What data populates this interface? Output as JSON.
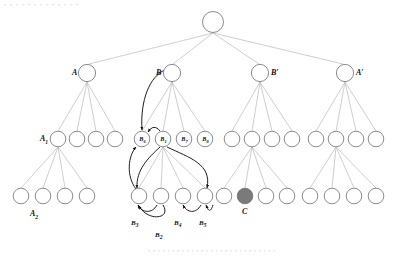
{
  "figure": {
    "type": "tree-diagram",
    "background_color": "#ffffff",
    "edge_color": "#b9b9bd",
    "node_stroke_color": "#6f6f76",
    "node_fill_color": "#ffffff",
    "arrow_color": "#111111",
    "highlight_fill_color": "#7a7a7a",
    "top_faint_text": "• • • • •      • • • • • • • •",
    "bottom_faint_text": "• • • • • • • • • • • • • • • • • • • • • • • • • • •"
  },
  "levels": {
    "root_y": 22,
    "level1_y": 73,
    "level2_y": 139,
    "level3_y": 196
  },
  "nodes": {
    "root": {
      "id": "root",
      "cx": 213,
      "cy": 22,
      "r": 11,
      "label": "",
      "fill": "#ffffff"
    },
    "level1": [
      {
        "id": "A",
        "cx": 87,
        "cy": 73,
        "r": 9,
        "label": "A",
        "label_pos": "left"
      },
      {
        "id": "B",
        "cx": 172,
        "cy": 73,
        "r": 9,
        "label": "B",
        "label_pos": "left"
      },
      {
        "id": "Bp",
        "cx": 260,
        "cy": 73,
        "r": 9,
        "label": "B′",
        "label_pos": "right"
      },
      {
        "id": "Ap",
        "cx": 345,
        "cy": 73,
        "r": 9,
        "label": "A′",
        "label_pos": "right"
      }
    ],
    "level2": [
      {
        "id": "A1",
        "cx": 58,
        "cy": 139,
        "r": 8,
        "label": "A",
        "sub": "1",
        "label_pos": "left",
        "inner": ""
      },
      {
        "id": "a2",
        "cx": 77,
        "cy": 139,
        "r": 8,
        "inner": ""
      },
      {
        "id": "a3",
        "cx": 96,
        "cy": 139,
        "r": 8,
        "inner": ""
      },
      {
        "id": "a4",
        "cx": 115,
        "cy": 139,
        "r": 8,
        "inner": ""
      },
      {
        "id": "B6",
        "cx": 142,
        "cy": 139,
        "r": 8,
        "inner": "B",
        "inner_sub": "6"
      },
      {
        "id": "B1",
        "cx": 163,
        "cy": 139,
        "r": 8,
        "inner": "B",
        "inner_sub": "1"
      },
      {
        "id": "B7",
        "cx": 184,
        "cy": 139,
        "r": 8,
        "inner": "B",
        "inner_sub": "7"
      },
      {
        "id": "B8",
        "cx": 205,
        "cy": 139,
        "r": 8,
        "inner": "B",
        "inner_sub": "8"
      },
      {
        "id": "c1",
        "cx": 232,
        "cy": 139,
        "r": 8,
        "inner": ""
      },
      {
        "id": "c2",
        "cx": 252,
        "cy": 139,
        "r": 8,
        "inner": ""
      },
      {
        "id": "c3",
        "cx": 272,
        "cy": 139,
        "r": 8,
        "inner": ""
      },
      {
        "id": "c4",
        "cx": 292,
        "cy": 139,
        "r": 8,
        "inner": ""
      },
      {
        "id": "d1",
        "cx": 316,
        "cy": 139,
        "r": 8,
        "inner": ""
      },
      {
        "id": "d2",
        "cx": 336,
        "cy": 139,
        "r": 8,
        "inner": ""
      },
      {
        "id": "d3",
        "cx": 356,
        "cy": 139,
        "r": 8,
        "inner": ""
      },
      {
        "id": "d4",
        "cx": 376,
        "cy": 139,
        "r": 8,
        "inner": ""
      }
    ],
    "level3": [
      {
        "id": "A2",
        "cx": 21,
        "cy": 196,
        "r": 8,
        "label": "A",
        "sub": "2",
        "label_pos": "below"
      },
      {
        "id": "e2",
        "cx": 43,
        "cy": 196,
        "r": 8
      },
      {
        "id": "e3",
        "cx": 65,
        "cy": 196,
        "r": 8
      },
      {
        "id": "e4",
        "cx": 87,
        "cy": 196,
        "r": 8
      },
      {
        "id": "f1",
        "cx": 139,
        "cy": 196,
        "r": 8,
        "arrow_label": "B",
        "arrow_sub": "3"
      },
      {
        "id": "f2",
        "cx": 161,
        "cy": 196,
        "r": 8
      },
      {
        "id": "f3",
        "cx": 183,
        "cy": 196,
        "r": 8,
        "arrow_label": "B",
        "arrow_sub": "4"
      },
      {
        "id": "f4",
        "cx": 205,
        "cy": 196,
        "r": 8,
        "arrow_label": "B",
        "arrow_sub": "5"
      },
      {
        "id": "g1",
        "cx": 224,
        "cy": 196,
        "r": 8
      },
      {
        "id": "C",
        "cx": 245,
        "cy": 196,
        "r": 8,
        "label": "C",
        "label_pos": "below",
        "fill": "#7a7a7a"
      },
      {
        "id": "g3",
        "cx": 266,
        "cy": 196,
        "r": 8
      },
      {
        "id": "g4",
        "cx": 287,
        "cy": 196,
        "r": 8
      },
      {
        "id": "h1",
        "cx": 310,
        "cy": 196,
        "r": 8
      },
      {
        "id": "h2",
        "cx": 332,
        "cy": 196,
        "r": 8
      },
      {
        "id": "h3",
        "cx": 354,
        "cy": 196,
        "r": 8
      },
      {
        "id": "h4",
        "cx": 376,
        "cy": 196,
        "r": 8
      }
    ]
  },
  "labels": {
    "A": "A",
    "B": "B",
    "Bp": "B′",
    "Ap": "A′",
    "A1": "A",
    "A1_sub": "1",
    "A2": "A",
    "A2_sub": "2",
    "C": "C",
    "B1": "B",
    "B1_sub": "1",
    "B2": "B",
    "B2_sub": "2",
    "B3": "B",
    "B3_sub": "3",
    "B4": "B",
    "B4_sub": "4",
    "B5": "B",
    "B5_sub": "5",
    "B6": "B",
    "B6_sub": "6",
    "B7": "B",
    "B7_sub": "7",
    "B8": "B",
    "B8_sub": "8"
  },
  "arrows": [
    {
      "name": "B-to-B6",
      "from": "B",
      "to": "B6",
      "label": ""
    },
    {
      "name": "B1-to-B6",
      "from": "B1",
      "to": "B6",
      "label": "B1"
    },
    {
      "name": "B1-to-f1",
      "from": "B1",
      "to": "f1",
      "label": "B2"
    },
    {
      "name": "f1-to-B6",
      "from": "f1",
      "to": "B6",
      "label": "B3"
    },
    {
      "name": "f2-to-f1",
      "from": "f2",
      "to": "f1",
      "label": "B3"
    },
    {
      "name": "f4-to-f3",
      "from": "f4",
      "to": "f3",
      "label": "B4"
    },
    {
      "name": "B1-to-f4",
      "from": "B1",
      "to": "f4",
      "label": "B5"
    }
  ]
}
